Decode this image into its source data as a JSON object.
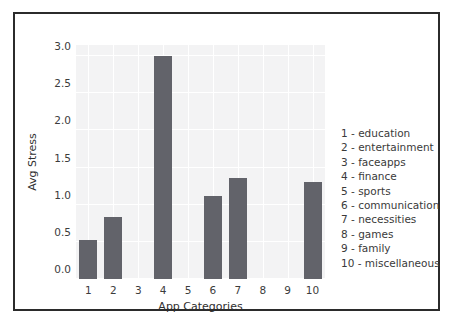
{
  "chart_data": {
    "type": "bar",
    "title": "",
    "xlabel": "App Categories",
    "ylabel": "Avg Stress",
    "categories": [
      "1",
      "2",
      "3",
      "4",
      "5",
      "6",
      "7",
      "8",
      "9",
      "10"
    ],
    "values": [
      0.52,
      0.83,
      0,
      3.0,
      0,
      1.12,
      1.36,
      0,
      0,
      1.31
    ],
    "ylim": [
      0,
      3.15
    ],
    "yticks": [
      "0.0",
      "0.5",
      "1.0",
      "1.5",
      "2.0",
      "2.5",
      "3.0"
    ],
    "ytick_values": [
      0.0,
      0.5,
      1.0,
      1.5,
      2.0,
      2.5,
      3.0
    ],
    "grid": true,
    "legend_position": "right-outside",
    "bar_color": "#62636a",
    "plot_background": "#f3f3f4",
    "gridline_color": "#ffffff",
    "frame_color": "#2b2b2b"
  },
  "legend": {
    "entries": [
      "1 - education",
      "2 - entertainment",
      "3 - faceapps",
      "4 - finance",
      "5 - sports",
      "6 - communication",
      "7 - necessities",
      "8 - games",
      "9 - family",
      "10 - miscellaneous"
    ]
  }
}
